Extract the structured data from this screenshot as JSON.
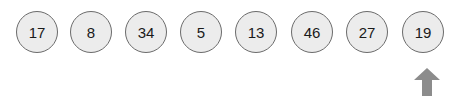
{
  "array": {
    "values": [
      "17",
      "8",
      "34",
      "5",
      "13",
      "46",
      "27",
      "19"
    ],
    "pointer_index": 7
  },
  "colors": {
    "node_fill": "#ececec",
    "node_stroke": "#6b6b6b",
    "arrow": "#8c8c8c"
  },
  "icons": {
    "pointer": "arrow-up-icon"
  }
}
